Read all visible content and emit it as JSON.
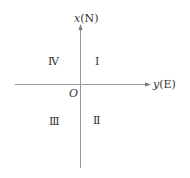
{
  "diagram": {
    "axes": {
      "vertical": {
        "variable": "x",
        "direction": "(N)"
      },
      "horizontal": {
        "variable": "y",
        "direction": "(E)"
      },
      "origin": "O"
    },
    "quadrants": {
      "q1": "Ⅰ",
      "q2": "Ⅱ",
      "q3": "Ⅲ",
      "q4": "Ⅳ"
    },
    "colors": {
      "axis": "#888888",
      "text": "#333333"
    }
  }
}
